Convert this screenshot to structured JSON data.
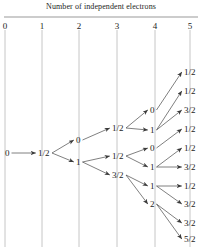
{
  "figure": {
    "title": "Number of independent electrons",
    "axis": {
      "tick_labels": [
        "0",
        "1",
        "2",
        "3",
        "4",
        "5"
      ],
      "tick_x": [
        5,
        42,
        79,
        117,
        155,
        190
      ],
      "label_y": 22,
      "rule_y": 17,
      "guide_top": 30,
      "guide_bottom": 247
    },
    "nodes": [
      {
        "id": "n0",
        "col": 0,
        "label": "0",
        "x": 5,
        "y": 153
      },
      {
        "id": "n1",
        "col": 1,
        "label": "1/2",
        "x": 38,
        "y": 153
      },
      {
        "id": "n2a",
        "col": 2,
        "label": "0",
        "x": 76,
        "y": 140
      },
      {
        "id": "n2b",
        "col": 2,
        "label": "1",
        "x": 76,
        "y": 162
      },
      {
        "id": "n3a",
        "col": 3,
        "label": "1/2",
        "x": 112,
        "y": 128
      },
      {
        "id": "n3b",
        "col": 3,
        "label": "1/2",
        "x": 112,
        "y": 156
      },
      {
        "id": "n3c",
        "col": 3,
        "label": "3/2",
        "x": 112,
        "y": 175
      },
      {
        "id": "n4a",
        "col": 4,
        "label": "0",
        "x": 150,
        "y": 110
      },
      {
        "id": "n4b",
        "col": 4,
        "label": "1",
        "x": 150,
        "y": 130
      },
      {
        "id": "n4c",
        "col": 4,
        "label": "0",
        "x": 150,
        "y": 148
      },
      {
        "id": "n4d",
        "col": 4,
        "label": "1",
        "x": 150,
        "y": 167
      },
      {
        "id": "n4e",
        "col": 4,
        "label": "1",
        "x": 150,
        "y": 186
      },
      {
        "id": "n4f",
        "col": 4,
        "label": "2",
        "x": 150,
        "y": 204
      },
      {
        "id": "n5a",
        "col": 5,
        "label": "1/2",
        "x": 184,
        "y": 72
      },
      {
        "id": "n5b",
        "col": 5,
        "label": "1/2",
        "x": 184,
        "y": 91
      },
      {
        "id": "n5c",
        "col": 5,
        "label": "3/2",
        "x": 184,
        "y": 110
      },
      {
        "id": "n5d",
        "col": 5,
        "label": "1/2",
        "x": 184,
        "y": 129
      },
      {
        "id": "n5e",
        "col": 5,
        "label": "1/2",
        "x": 184,
        "y": 148
      },
      {
        "id": "n5f",
        "col": 5,
        "label": "3/2",
        "x": 184,
        "y": 167
      },
      {
        "id": "n5g",
        "col": 5,
        "label": "1/2",
        "x": 184,
        "y": 186
      },
      {
        "id": "n5h",
        "col": 5,
        "label": "3/2",
        "x": 184,
        "y": 204
      },
      {
        "id": "n5i",
        "col": 5,
        "label": "3/2",
        "x": 184,
        "y": 223
      },
      {
        "id": "n5j",
        "col": 5,
        "label": "5/2",
        "x": 184,
        "y": 239
      }
    ],
    "edges": [
      {
        "from": "n0",
        "to": "n1"
      },
      {
        "from": "n1",
        "to": "n2a"
      },
      {
        "from": "n1",
        "to": "n2b"
      },
      {
        "from": "n2a",
        "to": "n3a"
      },
      {
        "from": "n2b",
        "to": "n3b"
      },
      {
        "from": "n2b",
        "to": "n3c"
      },
      {
        "from": "n3a",
        "to": "n4a"
      },
      {
        "from": "n3a",
        "to": "n4b"
      },
      {
        "from": "n3b",
        "to": "n4c"
      },
      {
        "from": "n3b",
        "to": "n4d"
      },
      {
        "from": "n3c",
        "to": "n4e"
      },
      {
        "from": "n3c",
        "to": "n4f"
      },
      {
        "from": "n4a",
        "to": "n5a"
      },
      {
        "from": "n4b",
        "to": "n5b"
      },
      {
        "from": "n4b",
        "to": "n5c"
      },
      {
        "from": "n4c",
        "to": "n5d"
      },
      {
        "from": "n4d",
        "to": "n5e"
      },
      {
        "from": "n4d",
        "to": "n5f"
      },
      {
        "from": "n4e",
        "to": "n5g"
      },
      {
        "from": "n4e",
        "to": "n5h"
      },
      {
        "from": "n4f",
        "to": "n5i"
      },
      {
        "from": "n4f",
        "to": "n5j"
      }
    ],
    "colors": {
      "ink": "#1d1d1d",
      "arrow": "#3a3a3a",
      "guide": "#b8b8b8",
      "rule": "#6e6e6e",
      "background": "#ffffff"
    }
  }
}
